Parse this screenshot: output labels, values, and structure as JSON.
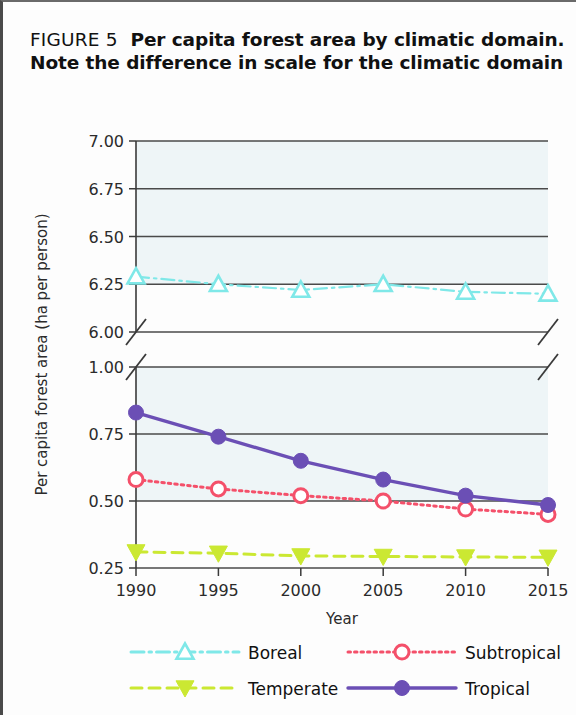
{
  "figure": {
    "tag": "FIGURE 5",
    "caption_line_1": "Per capita forest area by climatic domain.",
    "caption_line_2": "Note the difference in scale for the climatic domain"
  },
  "chart_data": {
    "type": "line",
    "title": "Per capita forest area by climatic domain",
    "xlabel": "Year",
    "ylabel": "Per capita forest area (ha per person)",
    "x": [
      1990,
      1995,
      2000,
      2005,
      2010,
      2015
    ],
    "x_tick_labels": [
      "1990",
      "1995",
      "2000",
      "2005",
      "2010",
      "2015"
    ],
    "broken_axis": true,
    "panels": [
      {
        "name": "upper",
        "ylim": [
          6.0,
          7.0
        ],
        "y_ticks": [
          6.0,
          6.25,
          6.5,
          6.75,
          7.0
        ],
        "y_tick_labels": [
          "6.00",
          "6.25",
          "6.50",
          "6.75",
          "7.00"
        ],
        "shaded_from": 6.25,
        "shaded_to": 7.0
      },
      {
        "name": "lower",
        "ylim": [
          0.25,
          1.0
        ],
        "y_ticks": [
          0.25,
          0.5,
          0.75,
          1.0
        ],
        "y_tick_labels": [
          "0.25",
          "0.50",
          "0.75",
          "1.00"
        ],
        "shaded_from": 0.5,
        "shaded_to": 1.0
      }
    ],
    "grid": true,
    "legend_position": "bottom",
    "series": [
      {
        "name": "Boreal",
        "panel": "upper",
        "color": "#7fe8e8",
        "marker": "triangle-up-open",
        "dash": "dashdot",
        "values": [
          6.29,
          6.25,
          6.22,
          6.25,
          6.21,
          6.2
        ]
      },
      {
        "name": "Subtropical",
        "panel": "lower",
        "color": "#f4506a",
        "marker": "circle-open",
        "dash": "dotted",
        "values": [
          0.58,
          0.545,
          0.52,
          0.5,
          0.47,
          0.45
        ]
      },
      {
        "name": "Temperate",
        "panel": "lower",
        "color": "#cbe832",
        "marker": "triangle-down-filled",
        "dash": "dashed",
        "values": [
          0.31,
          0.305,
          0.295,
          0.293,
          0.291,
          0.29
        ]
      },
      {
        "name": "Tropical",
        "panel": "lower",
        "color": "#6b4fb5",
        "marker": "circle-filled",
        "dash": "solid",
        "values": [
          0.83,
          0.74,
          0.65,
          0.58,
          0.52,
          0.485
        ]
      }
    ]
  },
  "legend": {
    "entries": [
      {
        "label": "Boreal",
        "color": "#7fe8e8",
        "marker": "triangle-up-open",
        "dash": "dashdot"
      },
      {
        "label": "Subtropical",
        "color": "#f4506a",
        "marker": "circle-open",
        "dash": "dotted"
      },
      {
        "label": "Temperate",
        "color": "#cbe832",
        "marker": "triangle-down-filled",
        "dash": "dashed"
      },
      {
        "label": "Tropical",
        "color": "#6b4fb5",
        "marker": "circle-filled",
        "dash": "solid"
      }
    ]
  },
  "colors": {
    "band_fill": "#eef5f7",
    "axis": "#3a3a3a",
    "background": "#fdfdfd"
  }
}
